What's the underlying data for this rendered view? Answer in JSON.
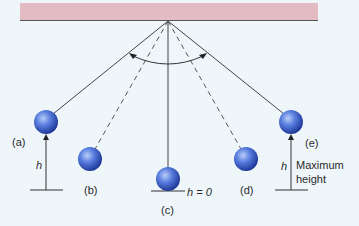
{
  "diagram": {
    "colors": {
      "background": "#eef6fa",
      "ceiling": "#e2bcc2",
      "ceiling_edge": "#555555",
      "string": "#444444",
      "bob_light": "#9fb8f2",
      "bob_mid": "#4a6fd6",
      "bob_dark": "#1f3a9a"
    },
    "pivot": {
      "x": 168,
      "y": 21
    },
    "positions": [
      {
        "id": "a",
        "label": "(a)",
        "x": 46,
        "y": 122,
        "line": "solid"
      },
      {
        "id": "b",
        "label": "(b)",
        "x": 90,
        "y": 159,
        "line": "dashed"
      },
      {
        "id": "c",
        "label": "(c)",
        "x": 168,
        "y": 180,
        "line": "solid"
      },
      {
        "id": "d",
        "label": "(d)",
        "x": 246,
        "y": 159,
        "line": "dashed"
      },
      {
        "id": "e",
        "label": "(e)",
        "x": 291,
        "y": 122,
        "line": "solid"
      }
    ],
    "height_labels": {
      "h_left": "h",
      "h_right": "h",
      "h_zero": "h = 0",
      "max_line1": "Maximum",
      "max_line2": "height"
    }
  }
}
